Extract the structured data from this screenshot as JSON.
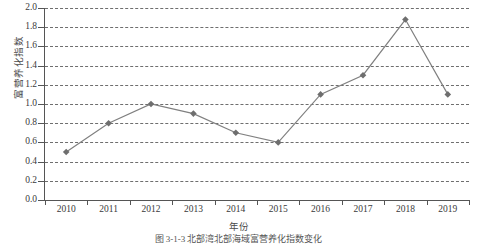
{
  "chart_data": {
    "type": "line",
    "title": "",
    "xlabel": "年份",
    "ylabel": "富营养化指数",
    "categories": [
      "2010",
      "2011",
      "2012",
      "2013",
      "2014",
      "2015",
      "2016",
      "2017",
      "2018",
      "2019"
    ],
    "values": [
      0.5,
      0.8,
      1.0,
      0.9,
      0.7,
      0.6,
      1.1,
      1.3,
      1.88,
      1.1
    ],
    "series": [
      {
        "name": "富营养化指数",
        "values": [
          0.5,
          0.8,
          1.0,
          0.9,
          0.7,
          0.6,
          1.1,
          1.3,
          1.88,
          1.1
        ]
      }
    ],
    "ylim": [
      0.0,
      2.0
    ],
    "ytick_step": 0.2,
    "yticks": [
      "0.0",
      "0.2",
      "0.4",
      "0.6",
      "0.8",
      "1.0",
      "1.2",
      "1.4",
      "1.6",
      "1.8",
      "2.0"
    ],
    "grid": "horizontal-dashed",
    "legend": "none",
    "marker": "diamond",
    "line_color": "#808080",
    "marker_color": "#6e6e6e",
    "grid_color": "#555555",
    "axis_color": "#555555"
  },
  "caption": "图 3-1-3  北部湾北部海域富营养化指数变化"
}
